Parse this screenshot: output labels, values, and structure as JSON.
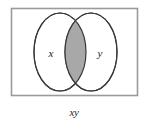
{
  "figure": {
    "name": "venn-diagram-intersection",
    "background_color": "#ffffff",
    "universe": {
      "label": "",
      "border_color": "#9a9a9a",
      "fill_color": "#ffffff",
      "x": 11,
      "y": 8,
      "width": 127,
      "height": 88
    },
    "sets": [
      {
        "id": "x",
        "label": "x",
        "label_x": 51,
        "label_y": 53,
        "outline_color": "#3a3a3a",
        "fill_color": "#ffffff",
        "center_x": 60,
        "center_y": 52,
        "radius_x": 26,
        "radius_y": 39
      },
      {
        "id": "y",
        "label": "y",
        "label_x": 100,
        "label_y": 53,
        "outline_color": "#3a3a3a",
        "fill_color": "#ffffff",
        "center_x": 91,
        "center_y": 52,
        "radius_x": 26,
        "radius_y": 39
      }
    ],
    "shaded_region": {
      "name": "intersection",
      "description": "x AND y",
      "fill_color": "#a8a8a8",
      "outline_color": "#3a3a3a"
    },
    "caption": {
      "text": "xy",
      "x": 74,
      "y": 112,
      "color": "#2a2a2a"
    }
  }
}
